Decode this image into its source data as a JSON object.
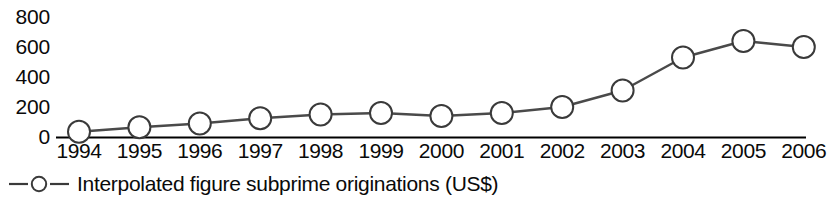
{
  "chart_data": {
    "type": "line",
    "title": "",
    "xlabel": "",
    "ylabel": "",
    "categories": [
      "1994",
      "1995",
      "1996",
      "1997",
      "1998",
      "1999",
      "2000",
      "2001",
      "2002",
      "2003",
      "2004",
      "2005",
      "2006"
    ],
    "series": [
      {
        "name": "Interpolated figure subprime originations (US$)",
        "values": [
          35,
          65,
          90,
          125,
          150,
          160,
          140,
          160,
          200,
          310,
          530,
          640,
          600
        ]
      }
    ],
    "ylim": [
      0,
      800
    ],
    "yticks": [
      0,
      200,
      400,
      600,
      800
    ],
    "ytick_labels": [
      "0",
      "200",
      "400",
      "600",
      "800"
    ],
    "grid": false,
    "legend_position": "bottom-left",
    "marker": "open-circle",
    "line_color": "#3a3a3a",
    "marker_fill": "#ffffff",
    "axis_color": "#000000"
  },
  "legend": {
    "label": "Interpolated figure subprime originations (US$)"
  }
}
